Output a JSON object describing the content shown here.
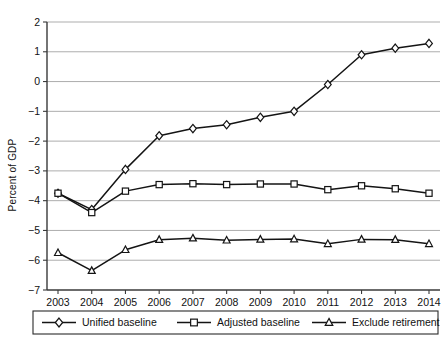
{
  "chart_data": {
    "type": "line",
    "title": "",
    "xlabel": "",
    "ylabel": "Percent of GDP",
    "categories": [
      "2003",
      "2004",
      "2005",
      "2006",
      "2007",
      "2008",
      "2009",
      "2010",
      "2011",
      "2012",
      "2013",
      "2014"
    ],
    "x": [
      2003,
      2004,
      2005,
      2006,
      2007,
      2008,
      2009,
      2010,
      2011,
      2012,
      2013,
      2014
    ],
    "ylim": [
      -7,
      2
    ],
    "xlim": [
      2003,
      2014
    ],
    "yticks": [
      2,
      1,
      0,
      -1,
      -2,
      -3,
      -4,
      -5,
      -6,
      -7
    ],
    "ytick_labels": [
      "2",
      "1",
      "0",
      "−1",
      "−2",
      "−3",
      "−4",
      "−5",
      "−6",
      "−7"
    ],
    "grid": true,
    "legend_position": "bottom",
    "series": [
      {
        "name": "Unified baseline",
        "marker": "diamond",
        "values": [
          -3.75,
          -4.3,
          -2.95,
          -1.82,
          -1.58,
          -1.45,
          -1.2,
          -1.0,
          -0.1,
          0.9,
          1.12,
          1.28
        ]
      },
      {
        "name": "Adjusted baseline",
        "marker": "square",
        "values": [
          -3.75,
          -4.4,
          -3.68,
          -3.46,
          -3.43,
          -3.46,
          -3.44,
          -3.44,
          -3.63,
          -3.5,
          -3.6,
          -3.75
        ]
      },
      {
        "name": "Exclude retirement",
        "marker": "triangle",
        "values": [
          -5.75,
          -6.35,
          -5.65,
          -5.31,
          -5.26,
          -5.33,
          -5.3,
          -5.29,
          -5.45,
          -5.3,
          -5.31,
          -5.45
        ]
      }
    ]
  },
  "legend": {
    "items": [
      {
        "label": "Unified baseline",
        "marker": "diamond"
      },
      {
        "label": "Adjusted baseline",
        "marker": "square"
      },
      {
        "label": "Exclude retirement",
        "marker": "triangle"
      }
    ]
  },
  "colors": {
    "line": "#141414",
    "grid": "#8a8a8a",
    "axis": "#3a3a3a",
    "marker_fill": "#ffffff",
    "background": "#ffffff"
  }
}
